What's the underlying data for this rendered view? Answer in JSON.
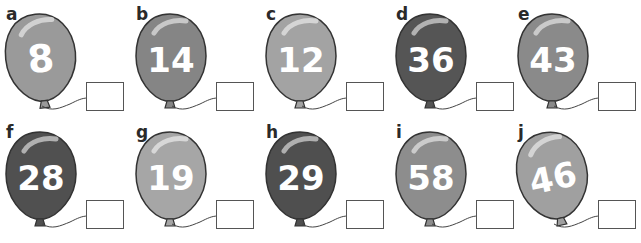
{
  "worksheet": {
    "balloons": [
      {
        "letter": "a",
        "number": "8",
        "fill": "#9a9a9a",
        "x": 0,
        "y": 0,
        "tilt": -6
      },
      {
        "letter": "b",
        "number": "14",
        "fill": "#858585",
        "x": 130,
        "y": 0,
        "tilt": 0
      },
      {
        "letter": "c",
        "number": "12",
        "fill": "#a3a3a3",
        "x": 260,
        "y": 0,
        "tilt": 0
      },
      {
        "letter": "d",
        "number": "36",
        "fill": "#555555",
        "x": 390,
        "y": 0,
        "tilt": 0
      },
      {
        "letter": "e",
        "number": "43",
        "fill": "#8a8a8a",
        "x": 512,
        "y": 0,
        "tilt": 0
      },
      {
        "letter": "f",
        "number": "28",
        "fill": "#505050",
        "x": 0,
        "y": 118,
        "tilt": 0
      },
      {
        "letter": "g",
        "number": "19",
        "fill": "#a6a6a6",
        "x": 130,
        "y": 118,
        "tilt": 0
      },
      {
        "letter": "h",
        "number": "29",
        "fill": "#4f4f4f",
        "x": 260,
        "y": 118,
        "tilt": 0
      },
      {
        "letter": "i",
        "number": "58",
        "fill": "#8d8d8d",
        "x": 390,
        "y": 118,
        "tilt": 0
      },
      {
        "letter": "j",
        "number": "46",
        "fill": "#a0a0a0",
        "x": 512,
        "y": 118,
        "tilt": -12
      }
    ]
  }
}
